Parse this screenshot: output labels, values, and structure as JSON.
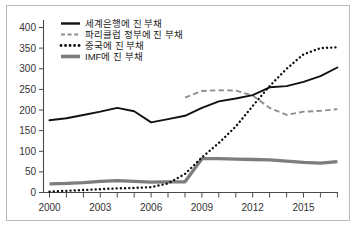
{
  "chart_data": {
    "type": "line",
    "title": "",
    "subtitle": "",
    "xlabel": "",
    "ylabel": "",
    "xlim": [
      2000,
      2017
    ],
    "ylim": [
      0,
      400
    ],
    "ytick_step": 50,
    "xtick_step": 1,
    "grid": false,
    "legend_position": "top-left",
    "yticks": [
      "0",
      "50",
      "100",
      "150",
      "200",
      "250",
      "300",
      "350",
      "400"
    ],
    "xticks": [
      "2000",
      "2003",
      "2006",
      "2009",
      "2012",
      "2015"
    ],
    "xtick_values": [
      2000,
      2003,
      2006,
      2009,
      2012,
      2015
    ],
    "x": [
      2000,
      2001,
      2002,
      2003,
      2004,
      2005,
      2006,
      2007,
      2008,
      2009,
      2010,
      2011,
      2012,
      2013,
      2014,
      2015,
      2016,
      2017
    ],
    "series": [
      {
        "name": "세계은행에 진 부채",
        "style": "solid",
        "color": "#111111",
        "x": [
          2000,
          2001,
          2002,
          2003,
          2004,
          2005,
          2006,
          2007,
          2008,
          2009,
          2010,
          2011,
          2012,
          2013,
          2014,
          2015,
          2016,
          2017
        ],
        "values": [
          175,
          180,
          188,
          196,
          205,
          197,
          170,
          178,
          186,
          205,
          221,
          228,
          236,
          255,
          258,
          268,
          282,
          303
        ]
      },
      {
        "name": "파리클럽 정부에 진 부채",
        "style": "dashed",
        "color": "#8e8e8e",
        "x": [
          2008,
          2009,
          2010,
          2011,
          2012,
          2013,
          2014,
          2015,
          2016,
          2017
        ],
        "values": [
          230,
          246,
          248,
          247,
          235,
          205,
          188,
          196,
          198,
          202
        ]
      },
      {
        "name": "중국에 진 부채",
        "style": "dotted",
        "color": "#111111",
        "x": [
          2000,
          2001,
          2002,
          2003,
          2004,
          2005,
          2006,
          2007,
          2008,
          2009,
          2010,
          2011,
          2012,
          2013,
          2014,
          2015,
          2016,
          2017
        ],
        "values": [
          2,
          4,
          6,
          8,
          10,
          11,
          13,
          22,
          45,
          85,
          120,
          160,
          210,
          258,
          300,
          335,
          350,
          352
        ]
      },
      {
        "name": "IMF에 진 부채",
        "style": "thick-solid",
        "color": "#7d7d7d",
        "x": [
          2000,
          2001,
          2002,
          2003,
          2004,
          2005,
          2006,
          2007,
          2008,
          2009,
          2010,
          2011,
          2012,
          2013,
          2014,
          2015,
          2016,
          2017
        ],
        "values": [
          21,
          22,
          24,
          27,
          29,
          27,
          25,
          26,
          26,
          82,
          82,
          81,
          80,
          79,
          76,
          73,
          71,
          75
        ]
      }
    ]
  }
}
